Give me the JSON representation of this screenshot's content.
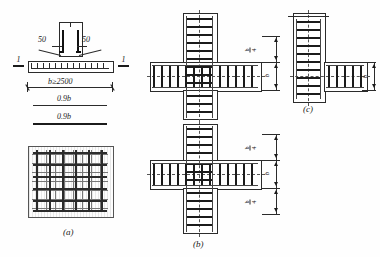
{
  "drawing": {
    "title": "Reinforced concrete footing and beam-column joint stirrup details",
    "sheet_background": "#ffffff",
    "line_color": "#2b2b2b"
  },
  "figures": [
    {
      "key": "a",
      "caption": "(a)",
      "description": "Footing elevation with dowel bars and reinforcement plan",
      "labels": {
        "dowel_left": "50",
        "dowel_right": "50",
        "width_dim": "b≥2500",
        "band_dim_1": "0.9b",
        "band_dim_2": "0.9b",
        "section_mark_left": "1",
        "section_mark_right": "1"
      }
    },
    {
      "key": "b",
      "caption": "(b)",
      "description": "Interior cross joint — column and beam stirrup layout",
      "dimensions_upper": [
        "b/4",
        "b"
      ],
      "dimensions_lower": [
        "b/4",
        "b",
        "b/4"
      ]
    },
    {
      "key": "c",
      "caption": "(c)",
      "description": "Corner (L-shaped) joint — column and beam stirrup layout",
      "dimensions": [
        "b"
      ]
    }
  ],
  "text": {
    "fifty_left": "50",
    "fifty_right": "50",
    "b_min": "b≥2500",
    "nine_tenths_b_top": "0.9b",
    "nine_tenths_b_bottom": "0.9b",
    "sec_1_left": "1",
    "sec_1_right": "1",
    "cap_a": "(a)",
    "cap_b": "(b)",
    "cap_c": "(c)",
    "b_num": "b",
    "b_den": "4",
    "b_plain": "b"
  }
}
